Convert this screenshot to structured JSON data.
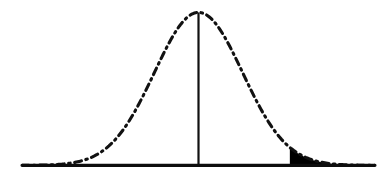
{
  "figure": {
    "width": 391,
    "height": 195,
    "background_color": "#ffffff",
    "ink_color": "#111111",
    "fill_color": "#000000",
    "faint_mark": " "
  },
  "chart_data": {
    "type": "area",
    "title": "",
    "subtitle": "",
    "xlabel": "",
    "ylabel": "",
    "legend": [],
    "grid": false,
    "legend_position": "none",
    "curve_style": "dash-dot",
    "xlim": [
      -4.0,
      4.0
    ],
    "ylim": [
      0,
      0.4
    ],
    "mean": 0,
    "std_dev": 1,
    "x": [
      -4.0,
      -3.75,
      -3.5,
      -3.25,
      -3.0,
      -2.75,
      -2.5,
      -2.25,
      -2.0,
      -1.75,
      -1.5,
      -1.25,
      -1.0,
      -0.75,
      -0.5,
      -0.25,
      0.0,
      0.25,
      0.5,
      0.75,
      1.0,
      1.25,
      1.5,
      1.75,
      2.0,
      2.25,
      2.5,
      2.75,
      3.0,
      3.25,
      3.5,
      3.75,
      4.0
    ],
    "values": [
      0.0001,
      0.0004,
      0.0009,
      0.002,
      0.0044,
      0.0091,
      0.0175,
      0.0317,
      0.054,
      0.0863,
      0.1295,
      0.1826,
      0.242,
      0.3011,
      0.3521,
      0.3867,
      0.3989,
      0.3867,
      0.3521,
      0.3011,
      0.242,
      0.1826,
      0.1295,
      0.0863,
      0.054,
      0.0317,
      0.0175,
      0.0091,
      0.0044,
      0.002,
      0.0009,
      0.0004,
      0.0001
    ],
    "shaded_region": {
      "label": "",
      "side": "right-tail",
      "x_start": 2.07,
      "x_end": 4.0,
      "fill_color": "#000000"
    },
    "center_marker": {
      "label": "",
      "x": 0,
      "style": "solid-vertical-line"
    },
    "axis": {
      "baseline": true,
      "ticks": [],
      "tick_labels": []
    }
  }
}
